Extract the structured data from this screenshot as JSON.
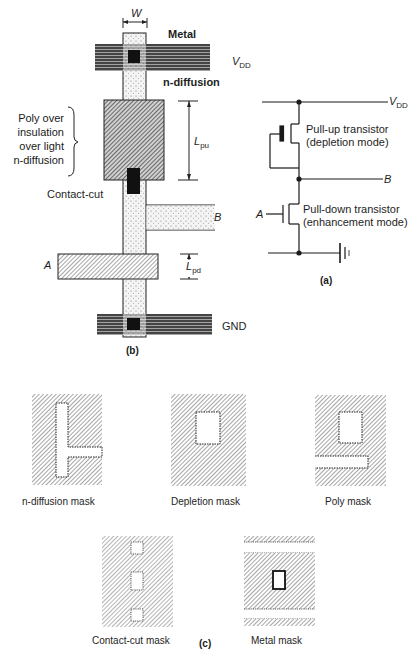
{
  "layout_b": {
    "dim_width": "W",
    "metal": "Metal",
    "vdd": "V",
    "vdd_sub": "DD",
    "n_diffusion": "n-diffusion",
    "poly_note": [
      "Poly over",
      "insulation",
      "over light",
      "n-diffusion"
    ],
    "lpu": "L",
    "lpu_sub": "pu",
    "contact_cut": "Contact-cut",
    "node_b": "B",
    "node_a": "A",
    "lpd": "L",
    "lpd_sub": "pd",
    "gnd": "GND",
    "caption": "(b)"
  },
  "schematic_a": {
    "vdd": "V",
    "vdd_sub": "DD",
    "pullup_line1": "Pull-up transistor",
    "pullup_line2": "(depletion mode)",
    "node_b": "B",
    "node_a": "A",
    "pulldown_line1": "Pull-down transistor",
    "pulldown_line2": "(enhancement mode)",
    "caption": "(a)"
  },
  "masks_c": {
    "items": [
      {
        "label": "n-diffusion mask"
      },
      {
        "label": "Depletion mask"
      },
      {
        "label": "Poly mask"
      },
      {
        "label": "Contact-cut mask"
      },
      {
        "label": "Metal mask"
      }
    ],
    "caption": "(c)"
  },
  "colors": {
    "ink": "#1a1a1a",
    "hatch": "#777777",
    "diffusion_fill": "#eeeeee"
  }
}
